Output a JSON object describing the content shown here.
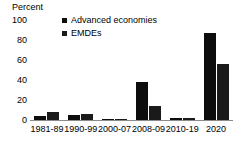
{
  "chart_data": {
    "type": "bar",
    "title": "",
    "ylabel": "Percent",
    "xlabel": "",
    "ylim": [
      0,
      100
    ],
    "yticks": [
      0,
      20,
      40,
      60,
      80,
      100
    ],
    "grid": false,
    "legend_position": "top-center",
    "categories": [
      "1981-89",
      "1990-99",
      "2000-07",
      "2008-09",
      "2010-19",
      "2020"
    ],
    "series": [
      {
        "name": "Advanced economies",
        "color": "#0d0d0d",
        "values": [
          4,
          5,
          1,
          38,
          2,
          87
        ]
      },
      {
        "name": "EMDEs",
        "color": "#1a1a1a",
        "values": [
          8,
          6,
          1,
          14,
          2,
          56
        ]
      }
    ]
  }
}
